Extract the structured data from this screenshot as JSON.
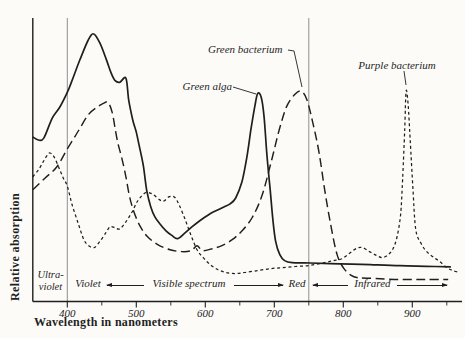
{
  "figure": {
    "background": "#fcfbf8",
    "ink": "#1f1f1f",
    "reference_line_color": "#8f8f8f"
  },
  "chart_data": {
    "type": "line",
    "title": "",
    "xlabel": "Wavelength in nanometers",
    "ylabel": "Relative absorption",
    "xlim_nm": [
      350,
      968
    ],
    "ylim_relative": [
      0,
      1
    ],
    "x_major_ticks_nm": [
      400,
      500,
      600,
      700,
      800,
      900
    ],
    "x_minor_ticks_nm": [
      450,
      550,
      650,
      750,
      850,
      950
    ],
    "grid": false,
    "reference_lines_nm": [
      400,
      750
    ],
    "regions": [
      {
        "label": "Ultra-\nviolet",
        "range_nm": [
          350,
          400
        ]
      },
      {
        "label": "Violet",
        "range_nm": [
          400,
          455
        ]
      },
      {
        "label": "Visible spectrum",
        "range_nm": [
          400,
          750
        ]
      },
      {
        "label": "Red",
        "range_nm": [
          700,
          750
        ]
      },
      {
        "label": "Infrared",
        "range_nm": [
          750,
          968
        ]
      }
    ],
    "series": [
      {
        "name": "Green alga",
        "line_style": "solid",
        "peaks_nm": [
          438,
          676
        ],
        "points_nm_absorption": [
          [
            350,
            0.607
          ],
          [
            358,
            0.596
          ],
          [
            366,
            0.603
          ],
          [
            378,
            0.676
          ],
          [
            389,
            0.717
          ],
          [
            400,
            0.772
          ],
          [
            407,
            0.816
          ],
          [
            418,
            0.89
          ],
          [
            430,
            0.963
          ],
          [
            438,
            0.988
          ],
          [
            447,
            0.955
          ],
          [
            456,
            0.897
          ],
          [
            463,
            0.846
          ],
          [
            469,
            0.816
          ],
          [
            476,
            0.809
          ],
          [
            485,
            0.824
          ],
          [
            489,
            0.743
          ],
          [
            495,
            0.669
          ],
          [
            500,
            0.625
          ],
          [
            504,
            0.577
          ],
          [
            510,
            0.504
          ],
          [
            515,
            0.412
          ],
          [
            521,
            0.349
          ],
          [
            527,
            0.312
          ],
          [
            534,
            0.287
          ],
          [
            543,
            0.261
          ],
          [
            552,
            0.243
          ],
          [
            560,
            0.232
          ],
          [
            571,
            0.254
          ],
          [
            581,
            0.276
          ],
          [
            592,
            0.298
          ],
          [
            607,
            0.324
          ],
          [
            618,
            0.338
          ],
          [
            627,
            0.349
          ],
          [
            636,
            0.36
          ],
          [
            644,
            0.382
          ],
          [
            653,
            0.441
          ],
          [
            660,
            0.529
          ],
          [
            666,
            0.632
          ],
          [
            672,
            0.724
          ],
          [
            676,
            0.768
          ],
          [
            681,
            0.754
          ],
          [
            685,
            0.688
          ],
          [
            689,
            0.551
          ],
          [
            694,
            0.412
          ],
          [
            698,
            0.301
          ],
          [
            702,
            0.221
          ],
          [
            708,
            0.173
          ],
          [
            715,
            0.151
          ],
          [
            726,
            0.143
          ],
          [
            752,
            0.142
          ],
          [
            795,
            0.139
          ],
          [
            839,
            0.136
          ],
          [
            882,
            0.132
          ],
          [
            920,
            0.13
          ],
          [
            956,
            0.128
          ]
        ]
      },
      {
        "name": "Green bacterium",
        "line_style": "long-dash",
        "peaks_nm": [
          459,
          739
        ],
        "points_nm_absorption": [
          [
            350,
            0.412
          ],
          [
            368,
            0.456
          ],
          [
            385,
            0.497
          ],
          [
            400,
            0.563
          ],
          [
            416,
            0.629
          ],
          [
            430,
            0.688
          ],
          [
            443,
            0.717
          ],
          [
            453,
            0.732
          ],
          [
            459,
            0.735
          ],
          [
            465,
            0.699
          ],
          [
            469,
            0.643
          ],
          [
            473,
            0.588
          ],
          [
            479,
            0.529
          ],
          [
            485,
            0.46
          ],
          [
            490,
            0.39
          ],
          [
            496,
            0.335
          ],
          [
            505,
            0.28
          ],
          [
            516,
            0.24
          ],
          [
            531,
            0.21
          ],
          [
            549,
            0.191
          ],
          [
            566,
            0.184
          ],
          [
            580,
            0.188
          ],
          [
            588,
            0.206
          ],
          [
            596,
            0.188
          ],
          [
            610,
            0.195
          ],
          [
            624,
            0.206
          ],
          [
            639,
            0.228
          ],
          [
            653,
            0.26
          ],
          [
            668,
            0.31
          ],
          [
            682,
            0.39
          ],
          [
            695,
            0.51
          ],
          [
            707,
            0.632
          ],
          [
            718,
            0.72
          ],
          [
            730,
            0.765
          ],
          [
            739,
            0.776
          ],
          [
            747,
            0.746
          ],
          [
            756,
            0.658
          ],
          [
            765,
            0.548
          ],
          [
            773,
            0.412
          ],
          [
            782,
            0.28
          ],
          [
            791,
            0.173
          ],
          [
            800,
            0.125
          ],
          [
            810,
            0.099
          ],
          [
            821,
            0.088
          ],
          [
            846,
            0.085
          ],
          [
            882,
            0.081
          ],
          [
            918,
            0.081
          ],
          [
            952,
            0.081
          ]
        ]
      },
      {
        "name": "Purple bacterium",
        "line_style": "short-dash",
        "peaks_nm": [
          375,
          523,
          890
        ],
        "points_nm_absorption": [
          [
            350,
            0.46
          ],
          [
            358,
            0.485
          ],
          [
            365,
            0.515
          ],
          [
            371,
            0.54
          ],
          [
            375,
            0.548
          ],
          [
            381,
            0.533
          ],
          [
            388,
            0.493
          ],
          [
            394,
            0.456
          ],
          [
            400,
            0.426
          ],
          [
            407,
            0.357
          ],
          [
            416,
            0.287
          ],
          [
            424,
            0.228
          ],
          [
            431,
            0.206
          ],
          [
            439,
            0.199
          ],
          [
            447,
            0.221
          ],
          [
            456,
            0.254
          ],
          [
            462,
            0.276
          ],
          [
            469,
            0.272
          ],
          [
            476,
            0.268
          ],
          [
            485,
            0.294
          ],
          [
            494,
            0.331
          ],
          [
            502,
            0.371
          ],
          [
            513,
            0.401
          ],
          [
            523,
            0.397
          ],
          [
            534,
            0.375
          ],
          [
            540,
            0.371
          ],
          [
            547,
            0.386
          ],
          [
            555,
            0.386
          ],
          [
            562,
            0.357
          ],
          [
            571,
            0.301
          ],
          [
            579,
            0.246
          ],
          [
            588,
            0.191
          ],
          [
            597,
            0.162
          ],
          [
            607,
            0.136
          ],
          [
            618,
            0.118
          ],
          [
            630,
            0.107
          ],
          [
            643,
            0.103
          ],
          [
            657,
            0.107
          ],
          [
            676,
            0.114
          ],
          [
            694,
            0.121
          ],
          [
            711,
            0.125
          ],
          [
            730,
            0.129
          ],
          [
            749,
            0.132
          ],
          [
            766,
            0.14
          ],
          [
            784,
            0.15
          ],
          [
            798,
            0.158
          ],
          [
            810,
            0.18
          ],
          [
            820,
            0.197
          ],
          [
            828,
            0.199
          ],
          [
            838,
            0.184
          ],
          [
            848,
            0.17
          ],
          [
            856,
            0.162
          ],
          [
            864,
            0.17
          ],
          [
            872,
            0.195
          ],
          [
            878,
            0.24
          ],
          [
            883,
            0.32
          ],
          [
            886,
            0.45
          ],
          [
            889,
            0.632
          ],
          [
            891,
            0.776
          ],
          [
            894,
            0.724
          ],
          [
            897,
            0.596
          ],
          [
            901,
            0.412
          ],
          [
            905,
            0.265
          ],
          [
            913,
            0.213
          ],
          [
            921,
            0.184
          ],
          [
            930,
            0.165
          ],
          [
            940,
            0.147
          ],
          [
            950,
            0.125
          ],
          [
            959,
            0.114
          ],
          [
            968,
            0.107
          ]
        ]
      }
    ]
  }
}
